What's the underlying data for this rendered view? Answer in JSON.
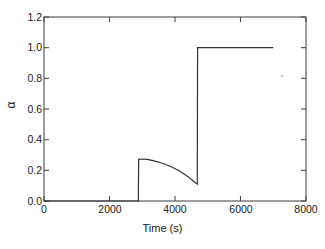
{
  "chart_data": {
    "type": "line",
    "title": "",
    "xlabel": "Time (s)",
    "ylabel": "α",
    "xlim": [
      0,
      8000
    ],
    "ylim": [
      0,
      1.2
    ],
    "xticks": [
      0,
      2000,
      4000,
      6000,
      8000
    ],
    "yticks": [
      0.0,
      0.2,
      0.4,
      0.6,
      0.8,
      1.0,
      1.2
    ],
    "xtick_labels": [
      "0",
      "2000",
      "4000",
      "6000",
      "8000"
    ],
    "ytick_labels": [
      "0.0",
      "0.2",
      "0.4",
      "0.6",
      "0.8",
      "1.0",
      "1.2"
    ],
    "grid": false,
    "legend": null,
    "line_color": "#333333",
    "line_width": 1.2,
    "series": [
      {
        "name": "alpha",
        "x": [
          0,
          500,
          1000,
          1500,
          2000,
          2500,
          2880,
          2890,
          3000,
          3150,
          3300,
          3500,
          3700,
          3900,
          4100,
          4300,
          4450,
          4600,
          4680,
          4690,
          4750,
          5000,
          5500,
          6000,
          6500,
          7000
        ],
        "y": [
          0.0,
          0.0,
          0.0,
          0.0,
          0.0,
          0.0,
          0.0,
          0.272,
          0.274,
          0.271,
          0.265,
          0.254,
          0.24,
          0.222,
          0.2,
          0.173,
          0.15,
          0.122,
          0.11,
          1.0,
          1.0,
          1.0,
          1.0,
          1.0,
          1.0,
          1.0
        ]
      }
    ],
    "annotations": [
      {
        "name": "dust-speck",
        "x": 7250,
        "y": 0.82
      }
    ]
  },
  "axes": {
    "frame_color": "#4d4d4d",
    "tick_direction": "in",
    "plot_left_px": 44,
    "plot_right_px": 306,
    "plot_top_px": 17,
    "plot_bottom_px": 201
  }
}
